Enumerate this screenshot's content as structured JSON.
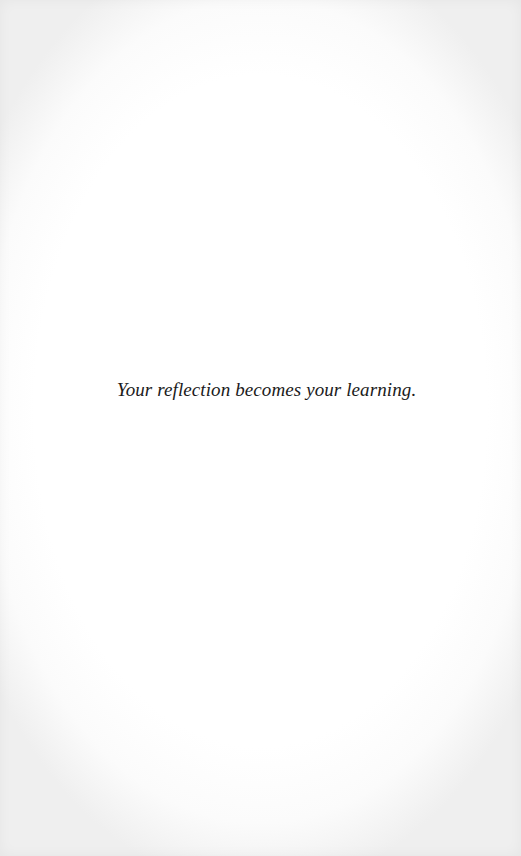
{
  "splash": {
    "quote": "Your reflection becomes your learning."
  },
  "colors": {
    "background": "#ffffff",
    "text": "#1b1b1b",
    "edge_vignette": "#efefef"
  }
}
